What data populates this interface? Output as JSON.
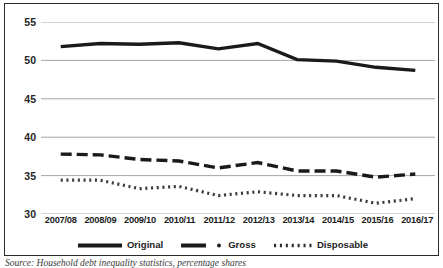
{
  "chart_data": {
    "type": "line",
    "title": "",
    "subtitle": "",
    "xlabel": "",
    "ylabel": "",
    "categories": [
      "2007/08",
      "2008/09",
      "2009/10",
      "2010/11",
      "2011/12",
      "2012/13",
      "2013/14",
      "2014/15",
      "2015/16",
      "2016/17"
    ],
    "ylim": [
      30,
      55
    ],
    "yticks": [
      30,
      35,
      40,
      45,
      50,
      55
    ],
    "ytick_labels": [
      "30",
      "35",
      "40",
      "45",
      "50",
      "55"
    ],
    "grid": "horizontal",
    "legend_position": "bottom",
    "series": [
      {
        "name": "Original",
        "style": "solid",
        "color": "#1a1a1a",
        "values": [
          51.8,
          52.2,
          52.1,
          52.3,
          51.5,
          52.2,
          50.1,
          49.9,
          49.1,
          48.7
        ]
      },
      {
        "name": "Gross",
        "style": "dashed",
        "color": "#1a1a1a",
        "values": [
          37.8,
          37.7,
          37.1,
          36.9,
          36.0,
          36.7,
          35.6,
          35.6,
          34.8,
          35.2
        ]
      },
      {
        "name": "Disposable",
        "style": "dotted",
        "color": "#3d3d3d",
        "values": [
          34.4,
          34.4,
          33.3,
          33.6,
          32.4,
          32.9,
          32.4,
          32.4,
          31.4,
          32.0
        ]
      }
    ]
  },
  "legend": {
    "items": [
      {
        "label": "Original",
        "key": "solid-line-key"
      },
      {
        "label": "Gross",
        "key": "dashed-line-key"
      },
      {
        "label": "Disposable",
        "key": "dotted-line-key"
      }
    ]
  },
  "caption": {
    "text": "Source: Household debt inequality statistics, percentage shares"
  }
}
